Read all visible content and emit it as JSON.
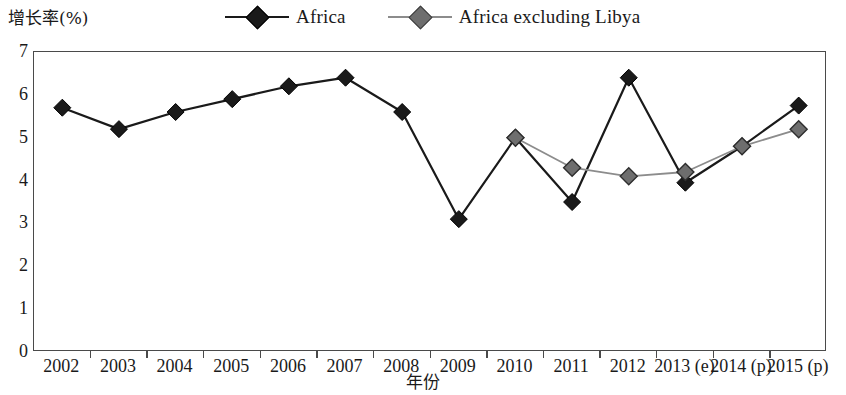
{
  "chart_data": {
    "type": "line",
    "title": "",
    "xlabel": "年份",
    "ylabel": "增长率(%)",
    "ylim": [
      0,
      7
    ],
    "yticks": [
      0,
      1,
      2,
      3,
      4,
      5,
      6,
      7
    ],
    "grid": false,
    "legend_position": "top",
    "categories": [
      "2002",
      "2003",
      "2004",
      "2005",
      "2006",
      "2007",
      "2008",
      "2009",
      "2010",
      "2011",
      "2012",
      "2013 (e)",
      "2014 (p)",
      "2015 (p)"
    ],
    "series": [
      {
        "name": "Africa",
        "color": "#1a1a1a",
        "marker": "diamond",
        "marker_fill": "#1a1a1a",
        "values": [
          5.7,
          5.2,
          5.6,
          5.9,
          6.2,
          6.4,
          5.6,
          3.1,
          5.0,
          3.5,
          6.4,
          3.95,
          4.8,
          5.75
        ]
      },
      {
        "name": "Africa excluding Libya",
        "color": "#8c8c8c",
        "marker": "diamond",
        "marker_fill": "#6e6e6e",
        "values": [
          null,
          null,
          null,
          null,
          null,
          null,
          null,
          null,
          5.0,
          4.3,
          4.1,
          4.2,
          4.8,
          5.2
        ]
      }
    ]
  },
  "legend": {
    "items": [
      {
        "label": "Africa",
        "color": "#1a1a1a",
        "fill": "#1a1a1a"
      },
      {
        "label": "Africa excluding Libya",
        "color": "#8c8c8c",
        "fill": "#6e6e6e"
      }
    ]
  },
  "axes": {
    "y_title": "增长率(%)",
    "x_title": "年份",
    "y_tick_labels": [
      "7",
      "6",
      "5",
      "4",
      "3",
      "2",
      "1",
      "0"
    ],
    "x_tick_labels": [
      "2002",
      "2003",
      "2004",
      "2005",
      "2006",
      "2007",
      "2008",
      "2009",
      "2010",
      "2011",
      "2012",
      "2013 (e)",
      "2014 (p)",
      "2015 (p)"
    ]
  }
}
